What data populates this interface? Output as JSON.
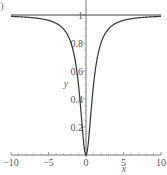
{
  "panel_label": ")",
  "chart_data": {
    "type": "line",
    "title": "",
    "xlabel": "x",
    "ylabel": "y",
    "xlim": [
      -10,
      10
    ],
    "ylim": [
      0,
      1
    ],
    "x_ticks": [
      -10,
      -5,
      0,
      5,
      10
    ],
    "x_tick_labels": [
      "−10",
      "−5",
      "0",
      "5",
      "10"
    ],
    "y_ticks": [
      0.2,
      0.4,
      0.6,
      0.8,
      1
    ],
    "y_tick_labels": [
      "0.2",
      "0.4",
      "0.6",
      "0.8",
      "1"
    ],
    "grid": false,
    "legend": null,
    "series": [
      {
        "name": "curve",
        "formula": "x^2/(1+x^2)",
        "x": [
          -10,
          -8,
          -6,
          -5,
          -4,
          -3,
          -2.5,
          -2,
          -1.5,
          -1.2,
          -1,
          -0.8,
          -0.6,
          -0.4,
          -0.2,
          0,
          0.2,
          0.4,
          0.6,
          0.8,
          1,
          1.2,
          1.5,
          2,
          2.5,
          3,
          4,
          5,
          6,
          8,
          10
        ],
        "values": [
          0.99,
          0.985,
          0.973,
          0.962,
          0.941,
          0.9,
          0.862,
          0.8,
          0.692,
          0.59,
          0.5,
          0.39,
          0.265,
          0.138,
          0.038,
          0.0,
          0.038,
          0.138,
          0.265,
          0.39,
          0.5,
          0.59,
          0.692,
          0.8,
          0.862,
          0.9,
          0.941,
          0.962,
          0.973,
          0.985,
          0.99
        ]
      },
      {
        "name": "asymptote y=1",
        "x": [
          -10,
          10
        ],
        "values": [
          1,
          1
        ]
      }
    ]
  }
}
